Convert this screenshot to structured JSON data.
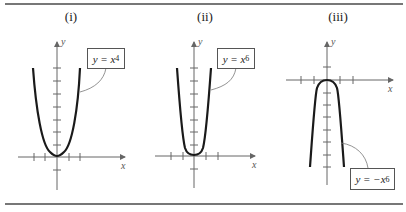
{
  "figure": {
    "panels": [
      {
        "label": "(i)",
        "equation": {
          "lhs": "y = x",
          "exponent": "4",
          "text": "y = x^4"
        },
        "x_axis_label": "x",
        "y_axis_label": "y",
        "shape": "even-power parabola-like curve opening upward, flatter near origin"
      },
      {
        "label": "(ii)",
        "equation": {
          "lhs": "y = x",
          "exponent": "6",
          "text": "y = x^6"
        },
        "x_axis_label": "x",
        "y_axis_label": "y",
        "shape": "even-power curve opening upward, flatter at bottom and steeper sides"
      },
      {
        "label": "(iii)",
        "equation": {
          "lhs": "y = −x",
          "exponent": "6",
          "text": "y = −x^6"
        },
        "x_axis_label": "x",
        "y_axis_label": "y",
        "shape": "reflection of y = x^6 across x-axis, opening downward"
      }
    ],
    "colors": {
      "curve": "#1a1a1a",
      "axis": "#666666",
      "rule": "#777777",
      "leader": "#777777"
    }
  }
}
